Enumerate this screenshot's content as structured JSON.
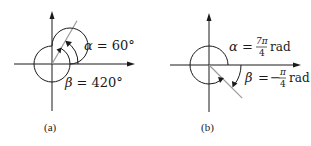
{
  "figures": [
    {
      "id": "a",
      "caption": "(a)",
      "alpha": {
        "symbol": "α",
        "eq": "=",
        "value": "60°",
        "degrees": 60
      },
      "beta": {
        "symbol": "β",
        "eq": "=",
        "value": "420°",
        "degrees": 420
      },
      "terminal_side_degrees": 60
    },
    {
      "id": "b",
      "caption": "(b)",
      "alpha": {
        "symbol": "α",
        "eq": "=",
        "num": "7π",
        "den": "4",
        "unit": "rad",
        "radians_over_pi": 1.75
      },
      "beta": {
        "symbol": "β",
        "eq": "=",
        "sign": "−",
        "num": "π",
        "den": "4",
        "unit": "rad",
        "radians_over_pi": -0.25
      },
      "terminal_side_degrees": -45
    }
  ],
  "colors": {
    "ink": "#1a1a1a",
    "ray": "#9a9a9a"
  }
}
